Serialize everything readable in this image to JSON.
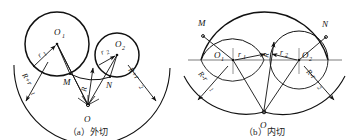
{
  "figure": {
    "title": "",
    "panels": [
      {
        "id": "a",
        "caption": "（a）外切",
        "caption_label": "(a)",
        "caption_text": "外切",
        "type": "external-tangency",
        "points": {
          "O": "O",
          "O1": "O",
          "O1_sub": "1",
          "O2": "O",
          "O2_sub": "2",
          "M": "M",
          "N": "N"
        },
        "dimensions": {
          "R": "R",
          "r1": "r",
          "r1_sub": "1",
          "r2": "r",
          "r2_sub": "2",
          "Rr1": "R+r",
          "Rr1_sub": "1",
          "Rr2": "R+r",
          "Rr2_sub": "2"
        }
      },
      {
        "id": "b",
        "caption": "（b）内切",
        "caption_label": "(b)",
        "caption_text": "内切",
        "type": "internal-tangency",
        "points": {
          "O": "O",
          "O1": "O",
          "O1_sub": "1",
          "O2": "O",
          "O2_sub": "2",
          "M": "M",
          "N": "N"
        },
        "dimensions": {
          "R": "R",
          "r1": "r",
          "r1_sub": "1",
          "r2": "r",
          "r2_sub": "2",
          "Rr1": "R-r",
          "Rr1_sub": "1",
          "Rr2": "R-r",
          "Rr2_sub": "2"
        }
      }
    ],
    "colors": {
      "stroke": "#111111",
      "background": "#ffffff",
      "centerline": "#555555"
    }
  }
}
